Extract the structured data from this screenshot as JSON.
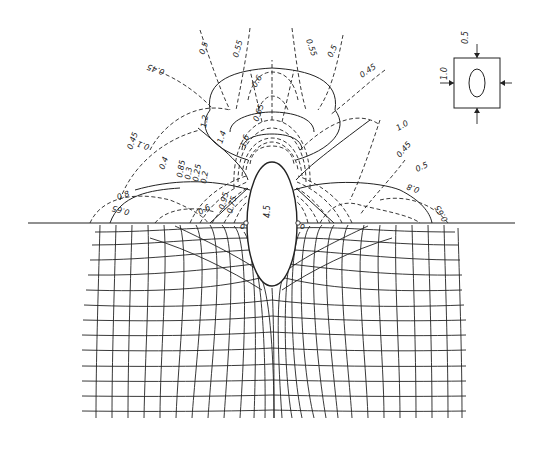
{
  "figure": {
    "hole_label": "4.5",
    "inset": {
      "top_load": "0.5",
      "side_load": "1.0"
    },
    "solid_contour_labels": [
      "0.1",
      "1.0",
      "0.4",
      "0.8",
      "0.8",
      "1.2",
      "1.4",
      "1.6",
      "0.6"
    ],
    "dashed_contour_labels": [
      "0.5",
      "0.55",
      "0.55",
      "0.5",
      "0.45",
      "0.65",
      "0.45",
      "0.45",
      "0.6",
      "0.5",
      "0.65",
      "0.65",
      "0.85",
      "0.3",
      "0.25",
      "0.2",
      "0.15",
      "0.95",
      "0.75"
    ],
    "left_labels": {
      "a": "0.45",
      "b": "0.45",
      "c": "0.1",
      "d": "0.4",
      "e": "0.8",
      "f": "0.65",
      "g": "0.6",
      "h": "0.85",
      "i": "0.3",
      "j": "0.25",
      "k": "0.2",
      "l": "0.15",
      "m": "0.95",
      "n": "0.75"
    },
    "top_labels": {
      "a": "0.5",
      "b": "0.55",
      "c": "0.55",
      "d": "0.5",
      "e": "0.45",
      "f": "0.6",
      "g": "0.65",
      "h": "0.7",
      "i": "1.2",
      "j": "1.4",
      "k": "1.6"
    },
    "right_labels": {
      "a": "1.0",
      "b": "0.45",
      "c": "0.5",
      "d": "0.8",
      "e": "0.65"
    },
    "point_markers": [
      "o",
      "o"
    ]
  }
}
